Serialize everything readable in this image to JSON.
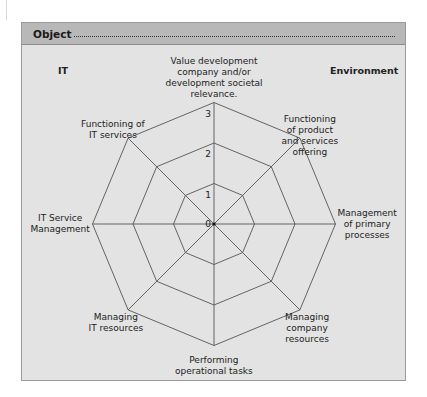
{
  "header": {
    "title": "Object"
  },
  "corners": {
    "left": "IT",
    "right": "Environment"
  },
  "axes": [
    {
      "id": "value-development",
      "label_lines": [
        "Value development",
        "company and/or",
        "development societal",
        "relevance."
      ]
    },
    {
      "id": "functioning-product",
      "label_lines": [
        "Functioning",
        "of product",
        "and services",
        "offering"
      ]
    },
    {
      "id": "management-primary",
      "label_lines": [
        "Management",
        "of primary",
        "processes"
      ]
    },
    {
      "id": "managing-company",
      "label_lines": [
        "Managing",
        "company",
        "resources"
      ]
    },
    {
      "id": "performing-operational",
      "label_lines": [
        "Performing",
        "operational tasks"
      ]
    },
    {
      "id": "managing-it-resources",
      "label_lines": [
        "Managing",
        "IT resources"
      ]
    },
    {
      "id": "it-service-management",
      "label_lines": [
        "IT Service",
        "Management"
      ]
    },
    {
      "id": "functioning-it-services",
      "label_lines": [
        "Functioning of",
        "IT services"
      ]
    }
  ],
  "scale": {
    "ticks": [
      "0",
      "1",
      "2",
      "3"
    ],
    "max": 3
  },
  "colors": {
    "panel_bg": "#e3e3e3",
    "header_bg": "#b8b8b8",
    "line": "#555555"
  },
  "chart_data": {
    "type": "radar",
    "title": "Object",
    "axes": [
      "Value development company and/or development societal relevance.",
      "Functioning of product and services offering",
      "Management of primary processes",
      "Managing company resources",
      "Performing operational tasks",
      "Managing IT resources",
      "IT Service Management",
      "Functioning of IT services"
    ],
    "rings": [
      1,
      2,
      3
    ],
    "range": [
      0,
      3
    ],
    "series": [],
    "annotations": [
      "IT",
      "Environment"
    ]
  }
}
